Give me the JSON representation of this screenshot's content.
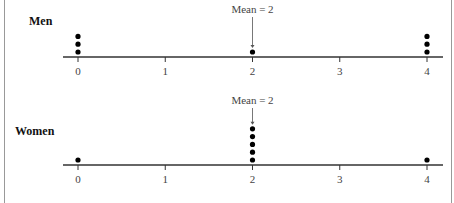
{
  "chart_data": [
    {
      "type": "scatter",
      "subtype": "dot_plot",
      "title": "Men",
      "x_ticks": [
        0,
        1,
        2,
        3,
        4
      ],
      "xlim": [
        0,
        4
      ],
      "points": [
        {
          "x": 0,
          "count": 3
        },
        {
          "x": 2,
          "count": 1
        },
        {
          "x": 4,
          "count": 3
        }
      ],
      "annotation": {
        "text": "Mean = 2",
        "x": 2
      }
    },
    {
      "type": "scatter",
      "subtype": "dot_plot",
      "title": "Women",
      "x_ticks": [
        0,
        1,
        2,
        3,
        4
      ],
      "xlim": [
        0,
        4
      ],
      "points": [
        {
          "x": 0,
          "count": 1
        },
        {
          "x": 2,
          "count": 5
        },
        {
          "x": 4,
          "count": 1
        }
      ],
      "annotation": {
        "text": "Mean = 2",
        "x": 2
      }
    }
  ],
  "labels": {
    "men": "Men",
    "women": "Women",
    "mean": "Mean = 2"
  },
  "ticks": [
    "0",
    "1",
    "2",
    "3",
    "4"
  ]
}
